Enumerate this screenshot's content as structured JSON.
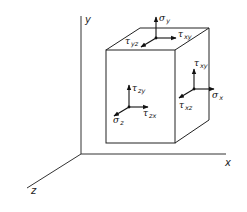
{
  "figure": {
    "axes": {
      "x_label": "x",
      "y_label": "y",
      "z_label": "z"
    },
    "top_face": {
      "normal_stress": {
        "symbol": "σ",
        "sub": "y"
      },
      "shear_1": {
        "symbol": "τ",
        "sub": "xy"
      },
      "shear_2": {
        "symbol": "τ",
        "sub": "yz"
      }
    },
    "right_face": {
      "normal_stress": {
        "symbol": "σ",
        "sub": "x"
      },
      "shear_1": {
        "symbol": "τ",
        "sub": "xy"
      },
      "shear_2": {
        "symbol": "τ",
        "sub": "xz"
      }
    },
    "front_face": {
      "normal_stress": {
        "symbol": "σ",
        "sub": "z"
      },
      "shear_1": {
        "symbol": "τ",
        "sub": "zy"
      },
      "shear_2": {
        "symbol": "τ",
        "sub": "zx"
      }
    },
    "colors": {
      "stroke": "#222222",
      "background": "#ffffff"
    }
  }
}
